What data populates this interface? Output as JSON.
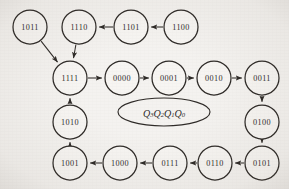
{
  "diagram": {
    "legend": {
      "label_base": "Q",
      "label_full": "Q3Q2Q1Q0",
      "subscripts": [
        "3",
        "2",
        "1",
        "0"
      ]
    },
    "style": {
      "background_color": "#f3f1ee",
      "node_fill": "#f6f4f1",
      "stroke_color": "#16120f",
      "text_color": "#100d0b",
      "node_radius": 17
    },
    "nodes": [
      {
        "id": "1011",
        "label": "1011",
        "cx": 30,
        "cy": 27,
        "r": 17
      },
      {
        "id": "1110",
        "label": "1110",
        "cx": 79,
        "cy": 27,
        "r": 17
      },
      {
        "id": "1101",
        "label": "1101",
        "cx": 131,
        "cy": 27,
        "r": 17
      },
      {
        "id": "1100",
        "label": "1100",
        "cx": 181,
        "cy": 27,
        "r": 17
      },
      {
        "id": "1111",
        "label": "1111",
        "cx": 70,
        "cy": 78,
        "r": 17
      },
      {
        "id": "0000",
        "label": "0000",
        "cx": 122,
        "cy": 78,
        "r": 17
      },
      {
        "id": "0001",
        "label": "0001",
        "cx": 169,
        "cy": 78,
        "r": 17
      },
      {
        "id": "0010",
        "label": "0010",
        "cx": 214,
        "cy": 78,
        "r": 17
      },
      {
        "id": "0011",
        "label": "0011",
        "cx": 262,
        "cy": 78,
        "r": 17
      },
      {
        "id": "0100",
        "label": "0100",
        "cx": 262,
        "cy": 122,
        "r": 17
      },
      {
        "id": "1010",
        "label": "1010",
        "cx": 70,
        "cy": 122,
        "r": 17
      },
      {
        "id": "1001",
        "label": "1001",
        "cx": 70,
        "cy": 163,
        "r": 17
      },
      {
        "id": "1000",
        "label": "1000",
        "cx": 120,
        "cy": 163,
        "r": 17
      },
      {
        "id": "0111",
        "label": "0111",
        "cx": 170,
        "cy": 163,
        "r": 17
      },
      {
        "id": "0110",
        "label": "0110",
        "cx": 215,
        "cy": 163,
        "r": 17
      },
      {
        "id": "0101",
        "label": "0101",
        "cx": 262,
        "cy": 163,
        "r": 17
      }
    ],
    "edges": [
      {
        "from": "1100",
        "to": "1101",
        "direction": "left"
      },
      {
        "from": "1101",
        "to": "1110",
        "direction": "left"
      },
      {
        "from": "1110",
        "to": "1111",
        "direction": "down-left"
      },
      {
        "from": "1011",
        "to": "1111",
        "direction": "down-right"
      },
      {
        "from": "1111",
        "to": "0000",
        "direction": "right"
      },
      {
        "from": "0000",
        "to": "0001",
        "direction": "right"
      },
      {
        "from": "0001",
        "to": "0010",
        "direction": "right"
      },
      {
        "from": "0010",
        "to": "0011",
        "direction": "right"
      },
      {
        "from": "0011",
        "to": "0100",
        "direction": "down"
      },
      {
        "from": "0100",
        "to": "0101",
        "direction": "down"
      },
      {
        "from": "0101",
        "to": "0110",
        "direction": "left"
      },
      {
        "from": "0110",
        "to": "0111",
        "direction": "left"
      },
      {
        "from": "0111",
        "to": "1000",
        "direction": "left"
      },
      {
        "from": "1000",
        "to": "1001",
        "direction": "left"
      },
      {
        "from": "1001",
        "to": "1010",
        "direction": "up"
      },
      {
        "from": "1010",
        "to": "1111",
        "direction": "up"
      }
    ],
    "legend_shape": {
      "cx": 164,
      "cy": 112,
      "rx": 46,
      "ry": 14
    }
  }
}
